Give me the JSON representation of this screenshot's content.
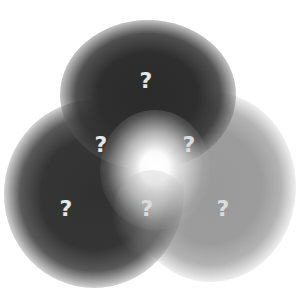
{
  "diagram": {
    "type": "venn-3-blurred",
    "regions": [
      {
        "id": "top-only",
        "label": "?",
        "shade": "#2b2b2b"
      },
      {
        "id": "top-left-overlap",
        "label": "?",
        "shade": "#7a7a7a"
      },
      {
        "id": "top-right-overlap",
        "label": "?",
        "shade": "#cfcfcf"
      },
      {
        "id": "left-only",
        "label": "?",
        "shade": "#333333"
      },
      {
        "id": "left-right-overlap",
        "label": "?",
        "shade": "#b8b8b8"
      },
      {
        "id": "right-only",
        "label": "?",
        "shade": "#9a9a9a"
      }
    ],
    "center_glow": "#ffffff",
    "background": "#ffffff",
    "label_color": "#e6e6e6"
  }
}
